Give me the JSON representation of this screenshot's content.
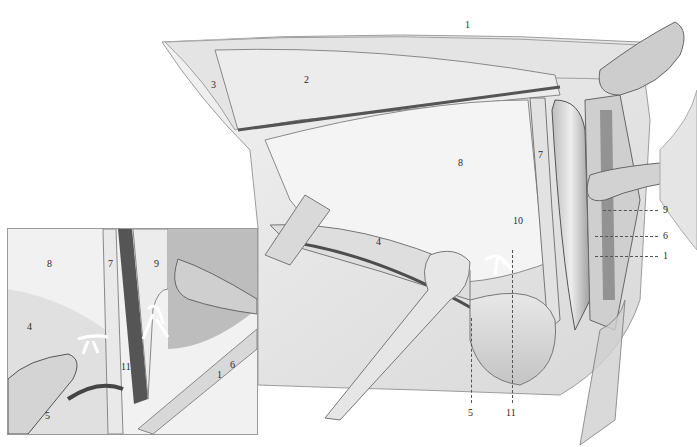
{
  "figure": {
    "main_labels": [
      {
        "id": "1",
        "text": "1",
        "x": 465,
        "y": 20
      },
      {
        "id": "2",
        "text": "2",
        "x": 304,
        "y": 75
      },
      {
        "id": "3",
        "text": "3",
        "x": 211,
        "y": 80
      },
      {
        "id": "7",
        "text": "7",
        "x": 538,
        "y": 150
      },
      {
        "id": "8",
        "text": "8",
        "x": 458,
        "y": 158
      },
      {
        "id": "10",
        "text": "10",
        "x": 513,
        "y": 216
      },
      {
        "id": "4",
        "text": "4",
        "x": 376,
        "y": 237
      }
    ],
    "leader_labels_right": [
      {
        "id": "9",
        "text": "9",
        "x": 663,
        "y": 205
      },
      {
        "id": "6",
        "text": "6",
        "x": 663,
        "y": 231
      },
      {
        "id": "1b",
        "text": "1",
        "x": 663,
        "y": 251
      }
    ],
    "leader_labels_bottom": [
      {
        "id": "5",
        "text": "5",
        "x": 468,
        "y": 408
      },
      {
        "id": "11",
        "text": "11",
        "x": 506,
        "y": 408
      }
    ],
    "inset": {
      "labels": [
        {
          "id": "8",
          "text": "8",
          "x": 47,
          "y": 259
        },
        {
          "id": "7",
          "text": "7",
          "x": 108,
          "y": 259
        },
        {
          "id": "9",
          "text": "9",
          "x": 154,
          "y": 259
        },
        {
          "id": "4",
          "text": "4",
          "x": 27,
          "y": 322
        },
        {
          "id": "11",
          "text": "11",
          "x": 121,
          "y": 362
        },
        {
          "id": "6",
          "text": "6",
          "x": 230,
          "y": 360
        },
        {
          "id": "1",
          "text": "1",
          "x": 217,
          "y": 370
        },
        {
          "id": "5",
          "text": "5",
          "x": 45,
          "y": 411
        }
      ]
    }
  }
}
